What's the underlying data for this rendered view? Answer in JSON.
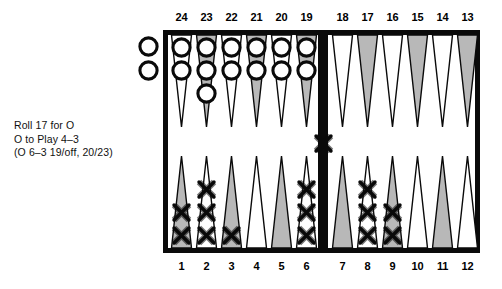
{
  "caption": {
    "line1": "Roll 17 for O",
    "line2": "O to Play 4–3",
    "line3": "(O 6–3 19/off, 20/23)"
  },
  "board": {
    "top_numbers": [
      "24",
      "23",
      "22",
      "21",
      "20",
      "19",
      "18",
      "17",
      "16",
      "15",
      "14",
      "13"
    ],
    "bottom_numbers": [
      "1",
      "2",
      "3",
      "4",
      "5",
      "6",
      "7",
      "8",
      "9",
      "10",
      "11",
      "12"
    ],
    "colors": {
      "frame": "#0a0a0a",
      "point_shaded": "#b8b8b8",
      "point_light": "#ffffff",
      "checker_outline": "#0a0a0a",
      "checker_fill": "#ffffff",
      "board_background": "#ffffff"
    },
    "top_points": [
      {
        "number": "24",
        "shade": "light",
        "checkers": 2,
        "player": "O"
      },
      {
        "number": "23",
        "shade": "shaded",
        "checkers": 3,
        "player": "O"
      },
      {
        "number": "22",
        "shade": "light",
        "checkers": 2,
        "player": "O"
      },
      {
        "number": "21",
        "shade": "shaded",
        "checkers": 2,
        "player": "O"
      },
      {
        "number": "20",
        "shade": "light",
        "checkers": 2,
        "player": "O"
      },
      {
        "number": "19",
        "shade": "shaded",
        "checkers": 2,
        "player": "O"
      },
      {
        "number": "18",
        "shade": "light",
        "checkers": 0,
        "player": ""
      },
      {
        "number": "17",
        "shade": "shaded",
        "checkers": 0,
        "player": ""
      },
      {
        "number": "16",
        "shade": "light",
        "checkers": 0,
        "player": ""
      },
      {
        "number": "15",
        "shade": "shaded",
        "checkers": 0,
        "player": ""
      },
      {
        "number": "14",
        "shade": "light",
        "checkers": 0,
        "player": ""
      },
      {
        "number": "13",
        "shade": "shaded",
        "checkers": 0,
        "player": ""
      }
    ],
    "bottom_points": [
      {
        "number": "1",
        "shade": "shaded",
        "checkers": 2,
        "player": "X"
      },
      {
        "number": "2",
        "shade": "light",
        "checkers": 3,
        "player": "X"
      },
      {
        "number": "3",
        "shade": "shaded",
        "checkers": 1,
        "player": "X"
      },
      {
        "number": "4",
        "shade": "light",
        "checkers": 0,
        "player": ""
      },
      {
        "number": "5",
        "shade": "shaded",
        "checkers": 0,
        "player": ""
      },
      {
        "number": "6",
        "shade": "light",
        "checkers": 3,
        "player": "X"
      },
      {
        "number": "7",
        "shade": "shaded",
        "checkers": 0,
        "player": ""
      },
      {
        "number": "8",
        "shade": "light",
        "checkers": 3,
        "player": "X"
      },
      {
        "number": "9",
        "shade": "shaded",
        "checkers": 2,
        "player": "X"
      },
      {
        "number": "10",
        "shade": "light",
        "checkers": 0,
        "player": ""
      },
      {
        "number": "11",
        "shade": "shaded",
        "checkers": 0,
        "player": ""
      },
      {
        "number": "12",
        "shade": "light",
        "checkers": 0,
        "player": ""
      }
    ],
    "bar": {
      "X_checkers": 1,
      "O_checkers": 0
    },
    "borne_off": {
      "O_checkers": 2,
      "X_checkers": 0
    }
  }
}
